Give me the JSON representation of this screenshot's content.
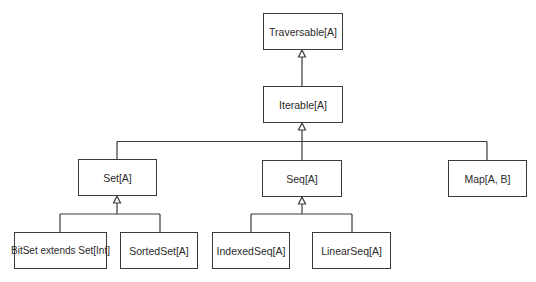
{
  "diagram": {
    "type": "class-hierarchy",
    "colors": {
      "line": "#3a3a3a",
      "text": "#2a2a2a",
      "background": "#ffffff"
    },
    "nodes": {
      "traversable": {
        "label": "Traversable[A]",
        "x": 263,
        "y": 13,
        "w": 80,
        "h": 37
      },
      "iterable": {
        "label": "Iterable[A]",
        "x": 263,
        "y": 86,
        "w": 80,
        "h": 37
      },
      "set": {
        "label": "Set[A]",
        "x": 78,
        "y": 159,
        "w": 79,
        "h": 37
      },
      "seq": {
        "label": "Seq[A]",
        "x": 262,
        "y": 160,
        "w": 80,
        "h": 37
      },
      "map": {
        "label": "Map[A, B]",
        "x": 448,
        "y": 160,
        "w": 79,
        "h": 37
      },
      "bitset": {
        "label": "BitSet extends Set[Int]",
        "x": 14,
        "y": 232,
        "w": 93,
        "h": 37
      },
      "sortedset": {
        "label": "SortedSet[A]",
        "x": 120,
        "y": 232,
        "w": 78,
        "h": 37
      },
      "indexedseq": {
        "label": "IndexedSeq[A]",
        "x": 212,
        "y": 232,
        "w": 78,
        "h": 37
      },
      "linearseq": {
        "label": "LinearSeq[A]",
        "x": 312,
        "y": 232,
        "w": 79,
        "h": 37
      }
    },
    "edges": [
      {
        "from": "iterable",
        "to": "traversable",
        "kind": "inheritance"
      },
      {
        "from": "set",
        "to": "iterable",
        "kind": "inheritance"
      },
      {
        "from": "seq",
        "to": "iterable",
        "kind": "inheritance"
      },
      {
        "from": "map",
        "to": "iterable",
        "kind": "inheritance"
      },
      {
        "from": "bitset",
        "to": "set",
        "kind": "inheritance"
      },
      {
        "from": "sortedset",
        "to": "set",
        "kind": "inheritance"
      },
      {
        "from": "indexedseq",
        "to": "seq",
        "kind": "inheritance"
      },
      {
        "from": "linearseq",
        "to": "seq",
        "kind": "inheritance"
      }
    ]
  }
}
